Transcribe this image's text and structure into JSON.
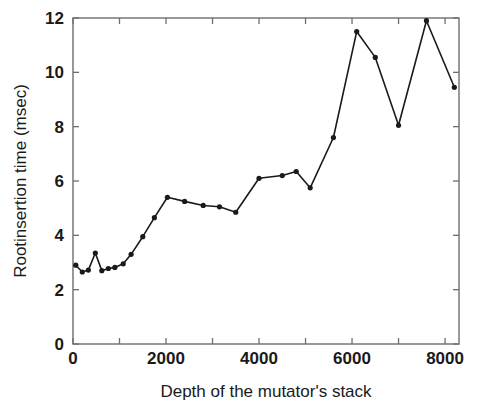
{
  "chart_data": {
    "type": "line",
    "title": "",
    "subtitle": "",
    "xlabel": "Depth of the mutator's stack",
    "ylabel": "Rootinsertion time (msec)",
    "xlim": [
      0,
      8300
    ],
    "ylim": [
      0,
      12
    ],
    "xticks": [
      0,
      1000,
      2000,
      3000,
      4000,
      5000,
      6000,
      7000,
      8000
    ],
    "xtick_labels": [
      "0",
      "",
      "2000",
      "",
      "4000",
      "",
      "6000",
      "",
      "8000"
    ],
    "yticks": [
      0,
      2,
      4,
      6,
      8,
      10,
      12
    ],
    "ytick_labels": [
      "0",
      "2",
      "4",
      "6",
      "8",
      "10",
      "12"
    ],
    "grid": false,
    "legend": false,
    "legend_position": "none",
    "marker": "filled-circle",
    "line_color": "#1a1a1a",
    "marker_color": "#1a1a1a",
    "x": [
      60,
      200,
      330,
      480,
      620,
      760,
      900,
      1080,
      1250,
      1500,
      1750,
      2030,
      2400,
      2800,
      3150,
      3500,
      4000,
      4500,
      4800,
      5100,
      5600,
      6100,
      6500,
      7000,
      7600,
      8200
    ],
    "y": [
      2.9,
      2.65,
      2.72,
      3.35,
      2.7,
      2.78,
      2.82,
      2.95,
      3.3,
      3.95,
      4.65,
      5.4,
      5.25,
      5.1,
      5.05,
      4.85,
      6.1,
      6.2,
      6.35,
      5.75,
      7.6,
      11.5,
      10.55,
      8.05,
      11.9,
      9.45
    ],
    "series": [
      {
        "name": "Rootinsertion time",
        "values": [
          2.9,
          2.65,
          2.72,
          3.35,
          2.7,
          2.78,
          2.82,
          2.95,
          3.3,
          3.95,
          4.65,
          5.4,
          5.25,
          5.1,
          5.05,
          4.85,
          6.1,
          6.2,
          6.35,
          5.75,
          7.6,
          11.5,
          10.55,
          8.05,
          11.9,
          9.45
        ]
      }
    ]
  }
}
